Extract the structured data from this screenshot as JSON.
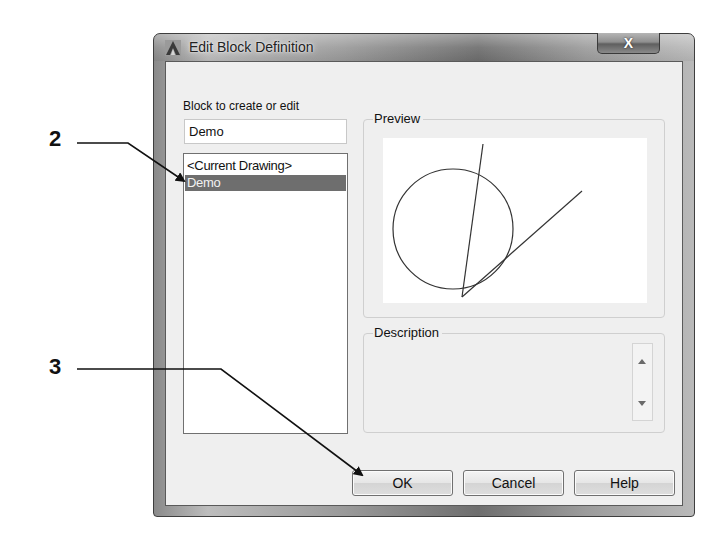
{
  "window": {
    "title": "Edit Block Definition",
    "app_icon": "autocad-a-icon",
    "close_label": "X"
  },
  "block_field": {
    "label": "Block to create or edit",
    "value": "Demo",
    "placeholder": ""
  },
  "block_list": {
    "items": [
      {
        "label": "<Current Drawing>",
        "selected": false
      },
      {
        "label": "Demo",
        "selected": true
      }
    ]
  },
  "preview": {
    "legend": "Preview",
    "drawing": "circle with two intersecting lines"
  },
  "description": {
    "legend": "Description",
    "value": ""
  },
  "buttons": {
    "ok": "OK",
    "cancel": "Cancel",
    "help": "Help"
  },
  "callouts": [
    {
      "number": "2",
      "target": "block-list-item-demo"
    },
    {
      "number": "3",
      "target": "ok-button"
    }
  ],
  "colors": {
    "selection": "#6e6e6e",
    "client_bg": "#efefef",
    "callout_line": "#111111"
  }
}
